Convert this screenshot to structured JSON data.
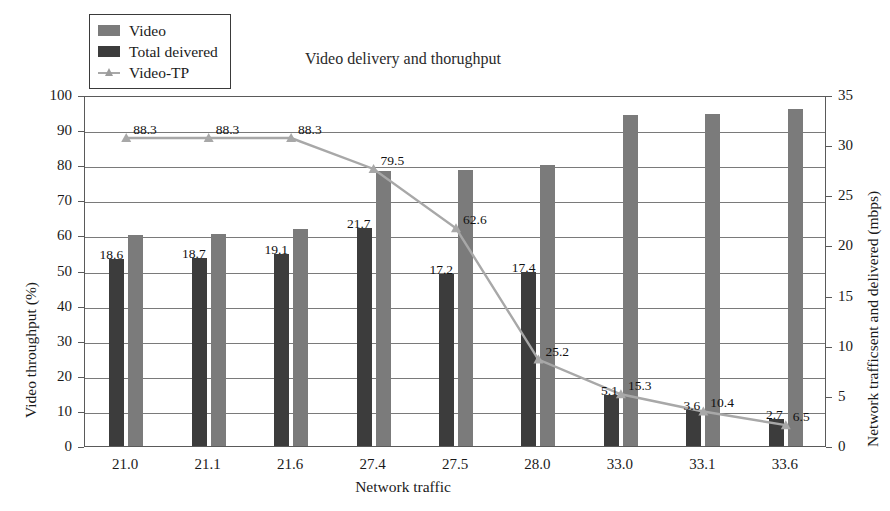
{
  "chart_data": {
    "type": "bar",
    "title": "Video delivery and thorughput",
    "xlabel": "Network traffic",
    "ylabel": "Video throughput (%)",
    "y2label": "Network trafficsent and delivered (mbps)",
    "categories": [
      "21.0",
      "21.1",
      "21.6",
      "27.4",
      "27.5",
      "28.0",
      "33.0",
      "33.1",
      "33.6"
    ],
    "ylim": [
      0,
      100
    ],
    "yticks": [
      "0",
      "10",
      "20",
      "30",
      "40",
      "50",
      "60",
      "70",
      "80",
      "90",
      "100"
    ],
    "y2lim": [
      0,
      35
    ],
    "y2ticks": [
      "0",
      "5",
      "10",
      "15",
      "20",
      "25",
      "30",
      "35"
    ],
    "grid": true,
    "legend_position": "top-left",
    "series": [
      {
        "name": "Video",
        "kind": "bar",
        "axis": "right",
        "color": "#7b7b7b",
        "values": [
          21.0,
          21.1,
          21.6,
          27.4,
          27.5,
          28.0,
          33.0,
          33.1,
          33.6
        ],
        "labels": [
          "",
          "",
          "",
          "",
          "",
          "",
          "",
          "",
          ""
        ]
      },
      {
        "name": "Total deivered",
        "kind": "bar",
        "axis": "right",
        "color": "#3c3c3c",
        "values": [
          18.6,
          18.7,
          19.1,
          21.7,
          17.2,
          17.4,
          5.1,
          3.6,
          2.7
        ],
        "labels": [
          "18.6",
          "18.7",
          "19.1",
          "21.7",
          "17.2",
          "17.4",
          "5.1",
          "3.6",
          "2.7"
        ]
      },
      {
        "name": "Video-TP",
        "kind": "line",
        "axis": "left",
        "color": "#a8a8a8",
        "values": [
          88.3,
          88.3,
          88.3,
          79.5,
          62.6,
          25.2,
          15.3,
          10.4,
          6.5
        ],
        "labels": [
          "88.3",
          "88.3",
          "88.3",
          "79.5",
          "62.6",
          "25.2",
          "15.3",
          "10.4",
          "6.5"
        ]
      }
    ]
  },
  "legend": {
    "items": [
      {
        "label": "Video",
        "marker": "bar-swatch-gray"
      },
      {
        "label": "Total deivered",
        "marker": "bar-swatch-dark"
      },
      {
        "label": "Video-TP",
        "marker": "line-triangle-marker"
      }
    ]
  }
}
